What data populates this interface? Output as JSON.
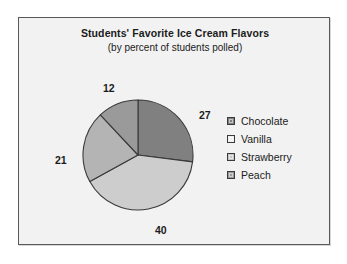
{
  "chart_data": {
    "type": "pie",
    "title": "Students' Favorite Ice Cream Flavors",
    "subtitle": "(by percent of students polled)",
    "xlabel": "",
    "ylabel": "",
    "units": "percent",
    "legend_position": "right",
    "grid": false,
    "start_angle_deg": 0,
    "direction": "clockwise",
    "categories": [
      "Chocolate",
      "Vanilla",
      "Strawberry",
      "Peach"
    ],
    "values": [
      27,
      40,
      21,
      12
    ],
    "labels": [
      "27",
      "40",
      "21",
      "12"
    ],
    "colors": [
      "#808080",
      "#cdcdcd",
      "#b4b4b4",
      "#9a9a9a"
    ],
    "slices": [
      {
        "name": "Chocolate",
        "value": 27,
        "label": "27",
        "color": "#808080"
      },
      {
        "name": "Vanilla",
        "value": 40,
        "label": "40",
        "color": "#cdcdcd"
      },
      {
        "name": "Strawberry",
        "value": 21,
        "label": "21",
        "color": "#b4b4b4"
      },
      {
        "name": "Peach",
        "value": 12,
        "label": "12",
        "color": "#9a9a9a"
      }
    ]
  },
  "legend": {
    "items": [
      {
        "label": "Chocolate",
        "color": "#808080"
      },
      {
        "label": "Vanilla",
        "color": "#efefef"
      },
      {
        "label": "Strawberry",
        "color": "#c6c6c6"
      },
      {
        "label": "Peach",
        "color": "#9a9a9a"
      }
    ]
  },
  "style": {
    "frame_border": "#58585a",
    "plate_background": "#f2f2f2",
    "page_background": "#ffffff",
    "slice_outline": "#3a3a3a",
    "text_color": "#1b1b1b"
  }
}
